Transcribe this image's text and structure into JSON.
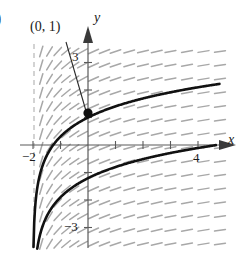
{
  "figure": {
    "part_label": ")",
    "background_color": "#ffffff",
    "axis_color": "#5a5a5a",
    "curve_color": "#111111",
    "slope_field_color": "#a8a8a8",
    "asymptote_color": "#b0b0b0",
    "point_color": "#111111"
  },
  "axes": {
    "x_label": "x",
    "y_label": "y",
    "x_tick_labels": [
      {
        "value": -2,
        "text": "−2"
      },
      {
        "value": 4,
        "text": "4"
      }
    ],
    "y_tick_labels": [
      {
        "value": 3,
        "text": "3"
      },
      {
        "value": -3,
        "text": "−3"
      }
    ],
    "xlim": [
      -2.3,
      5.4
    ],
    "ylim": [
      -3.9,
      3.9
    ],
    "origin_px": [
      88,
      145
    ],
    "unit_px": 27.5,
    "grid": false
  },
  "annotations": [
    {
      "name": "point-label",
      "text": "(0, 1)",
      "target_point": [
        0,
        1
      ],
      "leader_from_px": [
        66,
        42
      ],
      "leader_to_px": [
        86,
        111
      ]
    }
  ],
  "chart_data": {
    "type": "line",
    "title": "",
    "xlabel": "x",
    "ylabel": "y",
    "xlim": [
      -2.3,
      5.4
    ],
    "ylim": [
      -3.9,
      3.9
    ],
    "grid": false,
    "legend": "none",
    "vertical_asymptote": -2,
    "marked_points": [
      {
        "label": "(0, 1)",
        "x": 0,
        "y": 1
      }
    ],
    "slope_field": {
      "slope_formula": "1/(x+2)",
      "x_values": [
        -1.7,
        -1.4,
        -1.1,
        -0.8,
        -0.5,
        -0.2,
        0.2,
        0.6,
        1.0,
        1.5,
        2.0,
        2.5,
        3.0,
        3.6,
        4.2,
        4.8
      ],
      "y_values": [
        -3.6,
        -3.1,
        -2.6,
        -2.1,
        -1.6,
        -1.1,
        -0.6,
        -0.1,
        0.4,
        0.9,
        1.4,
        1.9,
        2.4,
        2.9,
        3.4
      ],
      "dash_length_px": 11
    },
    "series": [
      {
        "name": "upper-curve",
        "formula": "y = ln(x + 2) + 1 - ln(2)",
        "x": [
          -1.97,
          -1.95,
          -1.9,
          -1.8,
          -1.6,
          -1.3,
          -1.0,
          -0.5,
          0.0,
          0.5,
          1.0,
          1.5,
          2.0,
          2.5,
          3.0,
          3.5,
          4.0,
          4.5,
          4.73
        ],
        "y": [
          -2.21,
          -1.52,
          -0.83,
          -0.3,
          -0.6,
          -0.25,
          0.3,
          0.59,
          1.0,
          1.22,
          1.41,
          1.56,
          1.69,
          1.81,
          1.91,
          2.0,
          2.09,
          2.16,
          2.2
        ]
      },
      {
        "name": "lower-curve",
        "formula": "y = ln(x + 2) - 1.9",
        "x": [
          -1.97,
          -1.93,
          -1.85,
          -1.7,
          -1.4,
          -1.0,
          -0.5,
          0.0,
          0.6,
          1.2,
          1.8,
          2.4,
          3.0,
          3.6,
          4.2,
          4.6
        ],
        "y": [
          -3.8,
          -3.35,
          -2.95,
          -2.5,
          -1.9,
          -1.45,
          -1.1,
          -0.85,
          -0.6,
          -0.4,
          -0.2,
          -0.05,
          0.08,
          0.19,
          0.3,
          0.36
        ]
      }
    ]
  }
}
